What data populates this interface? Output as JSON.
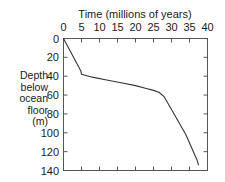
{
  "chart_data": {
    "type": "line",
    "title": "Time (millions of years)",
    "xlabel": "Time (millions of years)",
    "ylabel": "Depth below ocean floor (m)",
    "ylabel_lines": [
      "Depth",
      "below",
      "ocean",
      "floor",
      "(m)"
    ],
    "x_axis_position": "top",
    "y_axis_inverted": true,
    "xlim": [
      0,
      40
    ],
    "ylim": [
      0,
      140
    ],
    "xticks": [
      0,
      5,
      10,
      15,
      20,
      25,
      30,
      35,
      40
    ],
    "yticks": [
      0,
      20,
      40,
      60,
      80,
      100,
      120,
      140
    ],
    "xtick_labels": [
      "0",
      "5",
      "10",
      "15",
      "20",
      "25",
      "30",
      "35",
      "40"
    ],
    "ytick_labels": [
      "0",
      "20",
      "40",
      "60",
      "80",
      "100",
      "120",
      "140"
    ],
    "grid": false,
    "legend": "none",
    "series": [
      {
        "name": "Sediment accumulation",
        "color": "#333333",
        "x": [
          0,
          4.6,
          4.8,
          5.0,
          8,
          12,
          16,
          20,
          23,
          25,
          26.5,
          28,
          31,
          34,
          37,
          37.5
        ],
        "y": [
          0,
          33,
          34,
          38,
          41,
          44,
          47,
          50,
          53,
          55,
          57,
          62,
          82,
          102,
          128,
          134
        ]
      }
    ]
  },
  "axes": {
    "tick_color": "#555555",
    "frame_color": "#555555",
    "line_color": "#333333"
  }
}
